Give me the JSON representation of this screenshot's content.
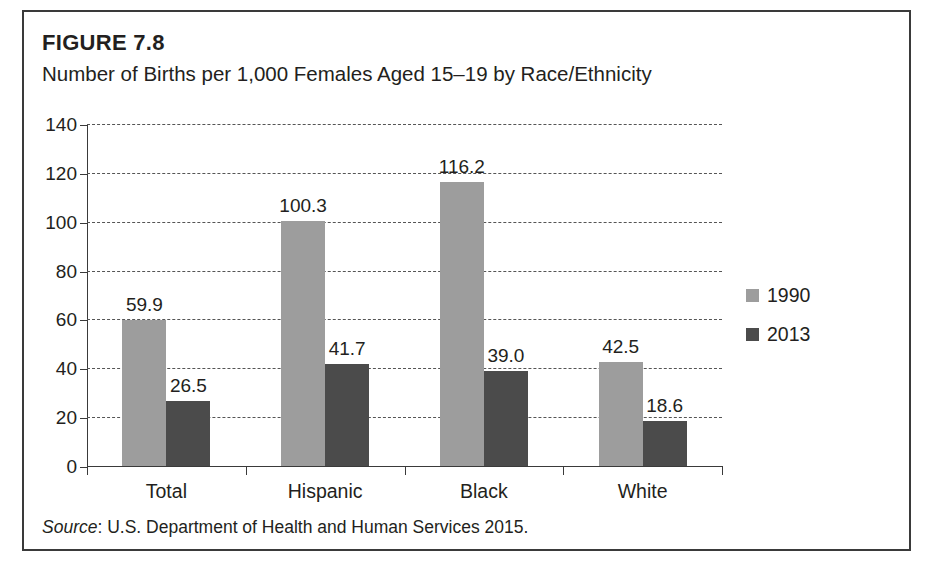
{
  "figure": {
    "label": "FIGURE 7.8",
    "title": "Number of Births per 1,000 Females Aged 15–19 by Race/Ethnicity",
    "source_word": "Source",
    "source_rest": ": U.S. Department of Health and Human Services 2015."
  },
  "chart_data": {
    "type": "bar",
    "title": "Number of Births per 1,000 Females Aged 15–19 by Race/Ethnicity",
    "xlabel": "",
    "ylabel": "",
    "ylim": [
      0,
      140
    ],
    "yticks": [
      0,
      20,
      40,
      60,
      80,
      100,
      120,
      140
    ],
    "ytick_labels": [
      "0",
      "20",
      "40",
      "60",
      "80",
      "100",
      "120",
      "140"
    ],
    "grid": true,
    "grid_style": "dashed-horizontal",
    "legend_position": "right",
    "categories": [
      "Total",
      "Hispanic",
      "Black",
      "White"
    ],
    "series": [
      {
        "name": "1990",
        "color": "#9d9d9d",
        "values": [
          59.9,
          100.3,
          116.2,
          42.5
        ],
        "labels": [
          "59.9",
          "100.3",
          "116.2",
          "42.5"
        ]
      },
      {
        "name": "2013",
        "color": "#4b4b4b",
        "values": [
          26.5,
          41.7,
          39.0,
          18.6
        ],
        "labels": [
          "26.5",
          "41.7",
          "39.0",
          "18.6"
        ]
      }
    ]
  },
  "colors": {
    "series_1990": "#9d9d9d",
    "series_2013": "#4b4b4b",
    "border": "#3a3a3a",
    "text": "#231f20"
  }
}
